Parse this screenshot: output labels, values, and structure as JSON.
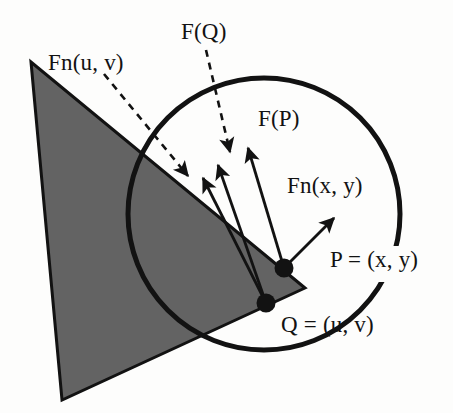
{
  "figure": {
    "background_color": "#fdfdfc",
    "stroke_color": "#121212",
    "fill_gray": "#636363",
    "labels": {
      "fn_uv": "Fn(u, v)",
      "f_q": "F(Q)",
      "f_p": "F(P)",
      "fn_xy": "Fn(x, y)",
      "point_p": "P = (x, y)",
      "point_q": "Q = (u, v)"
    },
    "shapes": {
      "triangle": {
        "name": "shaded-triangle",
        "points": "31,62 62,400 305,288",
        "fill": "#636363",
        "stroke": "#121212",
        "stroke_width": 3
      },
      "circle": {
        "name": "influence-circle",
        "cx": 264,
        "cy": 214,
        "r": 136,
        "stroke": "#121212",
        "stroke_width": 5,
        "gap_label": "P = (x, y)"
      }
    },
    "points": [
      {
        "name": "point-p",
        "label": "P = (x, y)",
        "cx": 284,
        "cy": 268,
        "r": 9
      },
      {
        "name": "point-q",
        "label": "Q = (u, v)",
        "cx": 266,
        "cy": 303,
        "r": 9
      }
    ],
    "vectors": [
      {
        "name": "vector-fn-xy",
        "from": "P",
        "x1": 284,
        "y1": 268,
        "x2": 332,
        "y2": 220,
        "style": "solid",
        "label": "Fn(x, y)"
      },
      {
        "name": "vector-f-p",
        "from": "P",
        "x1": 284,
        "y1": 268,
        "x2": 248,
        "y2": 148,
        "style": "solid",
        "label": "F(P)"
      },
      {
        "name": "vector-q-a",
        "from": "Q",
        "x1": 266,
        "y1": 303,
        "x2": 218,
        "y2": 165,
        "style": "solid",
        "label": "F(Q)"
      },
      {
        "name": "vector-q-b",
        "from": "Q",
        "x1": 266,
        "y1": 303,
        "x2": 203,
        "y2": 178,
        "style": "solid",
        "label": "Fn(u, v)"
      }
    ],
    "leaders": [
      {
        "name": "leader-fn-uv",
        "label": "Fn(u, v)",
        "x1": 104,
        "y1": 74,
        "x2": 188,
        "y2": 176,
        "style": "dashed"
      },
      {
        "name": "leader-f-q",
        "label": "F(Q)",
        "x1": 206,
        "y1": 50,
        "x2": 230,
        "y2": 152,
        "style": "dashed"
      }
    ]
  }
}
